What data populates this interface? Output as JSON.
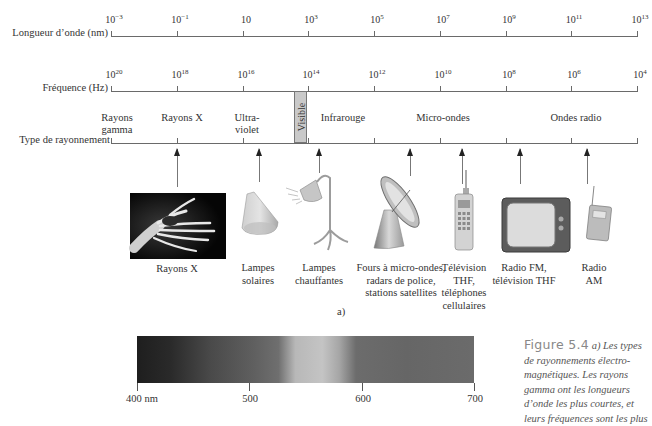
{
  "wavelength_axis": {
    "label": "Longueur d’onde (nm)",
    "ticks": [
      {
        "base": "10",
        "exp": "−3"
      },
      {
        "base": "10",
        "exp": "−1"
      },
      {
        "base": "10",
        "exp": ""
      },
      {
        "base": "10",
        "exp": "3"
      },
      {
        "base": "10",
        "exp": "5"
      },
      {
        "base": "10",
        "exp": "7"
      },
      {
        "base": "10",
        "exp": "9"
      },
      {
        "base": "10",
        "exp": "11"
      },
      {
        "base": "10",
        "exp": "13"
      }
    ]
  },
  "frequency_axis": {
    "label": "Fréquence (Hz)",
    "ticks": [
      {
        "base": "10",
        "exp": "20"
      },
      {
        "base": "10",
        "exp": "18"
      },
      {
        "base": "10",
        "exp": "16"
      },
      {
        "base": "10",
        "exp": "14"
      },
      {
        "base": "10",
        "exp": "12"
      },
      {
        "base": "10",
        "exp": "10"
      },
      {
        "base": "10",
        "exp": "8"
      },
      {
        "base": "10",
        "exp": "6"
      },
      {
        "base": "10",
        "exp": "4"
      }
    ]
  },
  "radiation_type_axis": {
    "label": "Type de rayonnement",
    "types": [
      {
        "line1": "Rayons",
        "line2": "gamma"
      },
      {
        "line1": "Rayons X",
        "line2": ""
      },
      {
        "line1": "Ultra-",
        "line2": "violet"
      },
      {
        "line1": "Infrarouge",
        "line2": ""
      },
      {
        "line1": "Micro-ondes",
        "line2": ""
      },
      {
        "line1": "Ondes radio",
        "line2": ""
      }
    ],
    "visible_band_label": "Visible"
  },
  "examples": [
    {
      "icon": "xray-hand-icon",
      "line1": "Rayons X",
      "line2": "",
      "line3": "",
      "line4": ""
    },
    {
      "icon": "sun-lamp-icon",
      "line1": "Lampes",
      "line2": "solaires",
      "line3": "",
      "line4": ""
    },
    {
      "icon": "heat-lamp-icon",
      "line1": "Lampes",
      "line2": "chauffantes",
      "line3": "",
      "line4": ""
    },
    {
      "icon": "satellite-dish-icon",
      "line1": "Fours à micro-ondes,",
      "line2": "radars de police,",
      "line3": "stations satellites",
      "line4": ""
    },
    {
      "icon": "cell-phone-icon",
      "line1": "Télévision",
      "line2": "THF,",
      "line3": "téléphones",
      "line4": "cellulaires"
    },
    {
      "icon": "television-icon",
      "line1": "Radio FM,",
      "line2": "télévision THF",
      "line3": "",
      "line4": ""
    },
    {
      "icon": "am-radio-icon",
      "line1": "Radio",
      "line2": "AM",
      "line3": "",
      "line4": ""
    }
  ],
  "part_label": "a)",
  "visible_spectrum": {
    "labels": [
      "400 nm",
      "500",
      "600",
      "700"
    ]
  },
  "figure_caption": {
    "title": "Figure 5.4",
    "lines": [
      "a) Les types",
      "de rayonnements électro-",
      "magnétiques. Les rayons",
      "gamma ont les longueurs",
      "d’onde les plus courtes, et",
      "leurs fréquences sont les plus"
    ]
  },
  "chart_data": {
    "type": "diagram",
    "axes": [
      {
        "label": "Longueur d’onde (nm)",
        "ticks": [
          "1e-3",
          "1e-1",
          "1e1",
          "1e3",
          "1e5",
          "1e7",
          "1e9",
          "1e11",
          "1e13"
        ]
      },
      {
        "label": "Fréquence (Hz)",
        "ticks": [
          "1e20",
          "1e18",
          "1e16",
          "1e14",
          "1e12",
          "1e10",
          "1e8",
          "1e6",
          "1e4"
        ]
      }
    ],
    "regions": [
      "Rayons gamma",
      "Rayons X",
      "Ultraviolet",
      "Visible",
      "Infrarouge",
      "Micro-ondes",
      "Ondes radio"
    ],
    "visible_spectrum_nm": [
      400,
      500,
      600,
      700
    ]
  }
}
